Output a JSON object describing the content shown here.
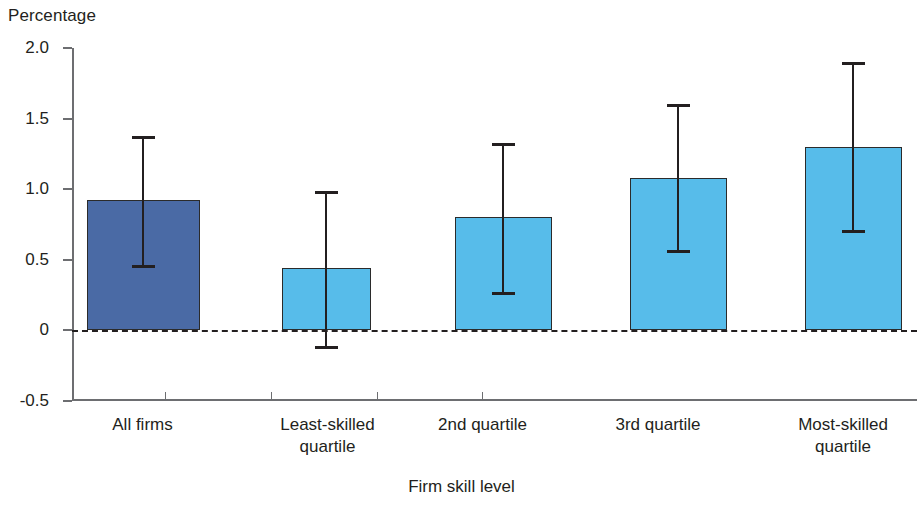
{
  "chart_data": {
    "type": "bar",
    "title": "",
    "ylabel": "Percentage",
    "xlabel": "Firm skill level",
    "ylim": [
      -0.5,
      2.0
    ],
    "ytick_labels": [
      "2.0",
      "1.5",
      "1.0",
      "0.5",
      "0",
      "-0.5"
    ],
    "ytick_values": [
      2.0,
      1.5,
      1.0,
      0.5,
      0,
      -0.5
    ],
    "grid": false,
    "legend": "none",
    "zero_reference_line": 0,
    "categories": [
      "All firms",
      "Least-skilled quartile",
      "2nd quartile",
      "3rd quartile",
      "Most-skilled quartile"
    ],
    "category_lines": [
      [
        "All firms"
      ],
      [
        "Least-skilled",
        "quartile"
      ],
      [
        "2nd quartile"
      ],
      [
        "3rd quartile"
      ],
      [
        "Most-skilled",
        "quartile"
      ]
    ],
    "values": [
      0.92,
      0.44,
      0.8,
      1.08,
      1.3
    ],
    "error_high": [
      1.38,
      0.99,
      1.33,
      1.6,
      1.9
    ],
    "error_low": [
      0.44,
      -0.13,
      0.25,
      0.55,
      0.69
    ],
    "bar_colors": [
      "#4a6aa5",
      "#57bcea",
      "#57bcea",
      "#57bcea",
      "#57bcea"
    ],
    "bar_border_color": "#2b2b2b",
    "error_color": "#231f20",
    "axis_color": "#6d6e71"
  }
}
